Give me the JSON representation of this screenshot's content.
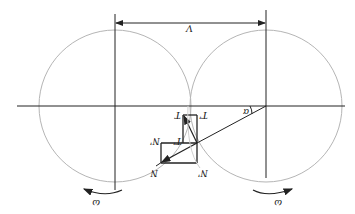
{
  "diagram": {
    "orientation": "rotated-180",
    "labels": {
      "velocity": "V",
      "angle": "α",
      "omega_left": "ω",
      "omega_right": "ω",
      "T": "T",
      "T_prime": "T'",
      "T_double_prime": "T'",
      "N": "N",
      "N_prime": "N'",
      "N_double_prime": "N'"
    },
    "colors": {
      "line": "#222222",
      "circle": "#b0b0b0"
    }
  }
}
